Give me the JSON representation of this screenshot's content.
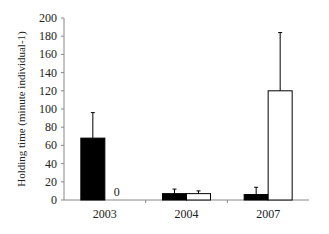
{
  "chart_data": {
    "type": "bar",
    "title": "",
    "xlabel": "",
    "ylabel": "Holding time (minute individual-1)",
    "ylim": [
      0,
      200
    ],
    "yticks": [
      0,
      20,
      40,
      60,
      80,
      100,
      120,
      140,
      160,
      180,
      200
    ],
    "categories": [
      "2003",
      "2004",
      "2007"
    ],
    "series": [
      {
        "name": "black",
        "color": "#000000",
        "values": [
          68,
          7,
          6
        ],
        "error_upper": [
          96,
          12,
          14
        ]
      },
      {
        "name": "white",
        "color": "#ffffff",
        "values": [
          0,
          7,
          120
        ],
        "error_upper": [
          null,
          10,
          184
        ]
      }
    ],
    "annotations": [
      {
        "category": "2003",
        "series": "white",
        "text": "0"
      }
    ],
    "grid": false,
    "legend": null
  }
}
